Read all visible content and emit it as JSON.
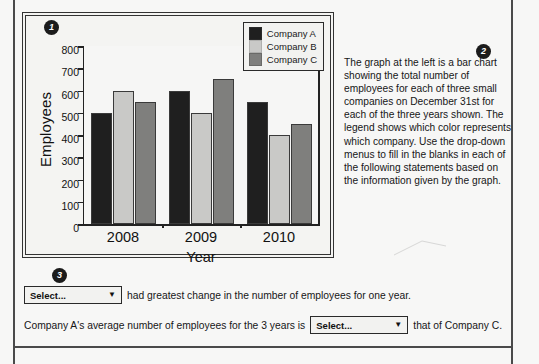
{
  "badges": {
    "one": "1",
    "two": "2",
    "three": "3"
  },
  "chart_data": {
    "type": "bar",
    "title": "",
    "xlabel": "Year",
    "ylabel": "Employees",
    "categories": [
      "2008",
      "2009",
      "2010"
    ],
    "ylim": [
      0,
      800
    ],
    "ytick_values": [
      "800",
      "700",
      "600",
      "500",
      "400",
      "300",
      "200",
      "100",
      "0"
    ],
    "grid": false,
    "legend_position": "top-right",
    "series": [
      {
        "name": "Company A",
        "color": "#1f1f1f",
        "values": [
          500,
          600,
          550
        ]
      },
      {
        "name": "Company B",
        "color": "#c9c9c7",
        "values": [
          600,
          500,
          400
        ]
      },
      {
        "name": "Company C",
        "color": "#7f7f7d",
        "values": [
          550,
          650,
          450
        ]
      }
    ],
    "series_note": "values indexed by series: A=[500,550,600], B=[600,500,400], C=[550,650,450] per year 2008/2009/2010"
  },
  "legend": {
    "items": [
      {
        "label": "Company A",
        "color": "#1f1f1f"
      },
      {
        "label": "Company B",
        "color": "#c9c9c7"
      },
      {
        "label": "Company C",
        "color": "#7f7f7d"
      }
    ]
  },
  "description": {
    "text": "The graph at the left is a bar chart showing the total number of employees for each of three small companies on December 31st for each of the three years shown. The legend shows which color represents which company. Use the drop-down menus to fill in the blanks in each of the following statements based on the information given by the graph."
  },
  "questions": {
    "statement_1": {
      "select_value": "Select...",
      "caret": "▼",
      "text_after": "had greatest change in the number of employees for one year."
    },
    "statement_2": {
      "text_before": "Company A's average number of employees for the 3 years is",
      "select_value": "Select...",
      "caret": "▼",
      "text_after": "that of Company C."
    }
  },
  "colors": {
    "frame": "#4a4a4a",
    "panel_bg": "#f4f4f2",
    "page_bg": "#f7f7f6",
    "badge_bg": "#1b1b1b"
  }
}
